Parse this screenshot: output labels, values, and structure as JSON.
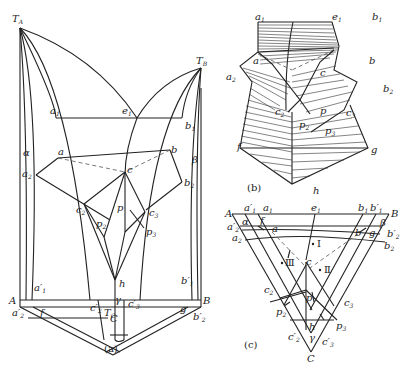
{
  "panels": {
    "a": {
      "caption": "(a)",
      "labels": {
        "TA": "T",
        "TA_sub": "A",
        "TB": "T",
        "TB_sub": "B",
        "a1": "a",
        "a1_sub": "1",
        "e1": "e",
        "e1_sub": "1",
        "b1": "b",
        "b1_sub": "1",
        "alpha": "α",
        "a": "a",
        "b": "b",
        "beta": "β",
        "a2": "a",
        "a2_sub": "2",
        "b2": "b",
        "b2_sub": "2",
        "c": "c",
        "c2": "c",
        "c2_sub": "2",
        "c3": "c",
        "c3_sub": "3",
        "p": "p",
        "p2": "p",
        "p2_sub": "2",
        "p3": "p",
        "p3_sub": "3",
        "a1p": "a′",
        "a1p_sub": "1",
        "b1p": "b′",
        "b1p_sub": "1",
        "A": "A",
        "B": "B",
        "a2p": "a′",
        "a2p_sub": "2",
        "b2p": "b′",
        "b2p_sub": "2",
        "f": "f",
        "g": "g",
        "Tc": "T",
        "Tc_sub": "C",
        "h": "h",
        "gamma": "γ",
        "c2p": "c′",
        "c2p_sub": "2",
        "c3p": "c′",
        "c3p_sub": "3",
        "C": "C"
      }
    },
    "b": {
      "caption": "(b)",
      "labels": {
        "a1": "a",
        "a1_sub": "1",
        "e1": "e",
        "e1_sub": "1",
        "b1": "b",
        "b1_sub": "1",
        "a": "a",
        "b": "b",
        "a2": "a",
        "a2_sub": "2",
        "b2": "b",
        "b2_sub": "2",
        "c": "c",
        "c2": "c",
        "c2_sub": "2",
        "c3": "c",
        "c3_sub": "3",
        "p": "p",
        "p2": "p",
        "p2_sub": "2",
        "p3": "p",
        "p3_sub": "3",
        "f": "f",
        "g": "g",
        "h": "h"
      }
    },
    "c": {
      "caption": "(c)",
      "labels": {
        "A": "A",
        "B": "B",
        "C": "C",
        "a1p": "a′",
        "a1p_sub": "1",
        "a1": "a",
        "a1_sub": "1",
        "e1": "e",
        "e1_sub": "1",
        "b1": "b",
        "b1_sub": "1",
        "b1p": "b′",
        "b1p_sub": "1",
        "alpha": "α",
        "f": "f",
        "a": "a",
        "b": "b",
        "g": "g",
        "beta": "β",
        "a2p": "a′",
        "a2p_sub": "2",
        "a2": "a",
        "a2_sub": "2",
        "b2p": "b′",
        "b2p_sub": "2",
        "b2": "b",
        "b2_sub": "2",
        "region1": "Ⅰ",
        "region2": "Ⅱ",
        "region3": "Ⅲ",
        "c": "c",
        "c2": "c",
        "c2_sub": "2",
        "c3": "c",
        "c3_sub": "3",
        "p": "p",
        "p2": "p",
        "p2_sub": "2",
        "p3": "p",
        "p3_sub": "3",
        "h": "h",
        "gamma": "γ",
        "c2p": "c′",
        "c2p_sub": "2",
        "c3p": "c′",
        "c3p_sub": "3"
      }
    }
  }
}
